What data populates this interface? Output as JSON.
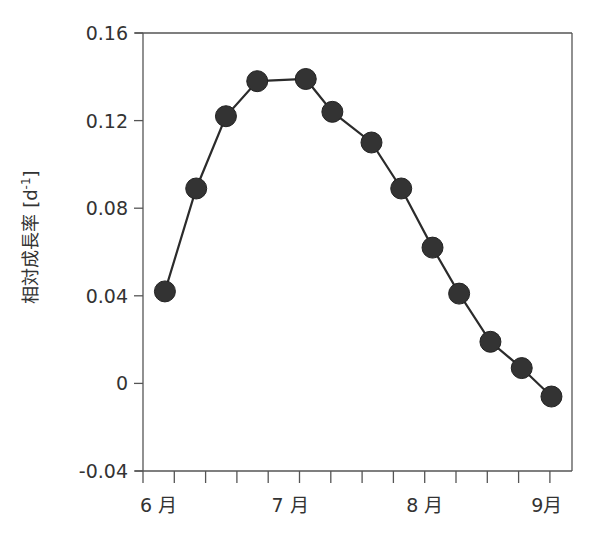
{
  "chart_data": {
    "type": "line",
    "title": "",
    "xlabel": "",
    "ylabel": "相対成長率 [d-1]",
    "ylabel_parts": {
      "main": "相対成長率 [d",
      "sup": "-1",
      "close": "]"
    },
    "ylim": [
      -0.04,
      0.16
    ],
    "yticks": [
      -0.04,
      0,
      0.04,
      0.08,
      0.12,
      0.16
    ],
    "ytick_labels": [
      "-0.04",
      "0",
      "0.04",
      "0.08",
      "0.12",
      "0.16"
    ],
    "xtick_labels": [
      {
        "label": "6 月",
        "pos": 0.5
      },
      {
        "label": "7 月",
        "pos": 4.7
      },
      {
        "label": "8 月",
        "pos": 9.0
      },
      {
        "label": "9月",
        "pos": 12.9
      }
    ],
    "xticks_minor_count": 13,
    "grid": false,
    "legend": null,
    "series": [
      {
        "name": "相対成長率",
        "marker": "filled-circle",
        "color": "#333333",
        "x": [
          0.7,
          1.7,
          2.65,
          3.65,
          5.2,
          6.05,
          7.3,
          8.25,
          9.25,
          10.1,
          11.1,
          12.1,
          13.05
        ],
        "values": [
          0.042,
          0.089,
          0.122,
          0.138,
          0.139,
          0.124,
          0.11,
          0.089,
          0.062,
          0.041,
          0.019,
          0.007,
          -0.006
        ]
      }
    ]
  }
}
